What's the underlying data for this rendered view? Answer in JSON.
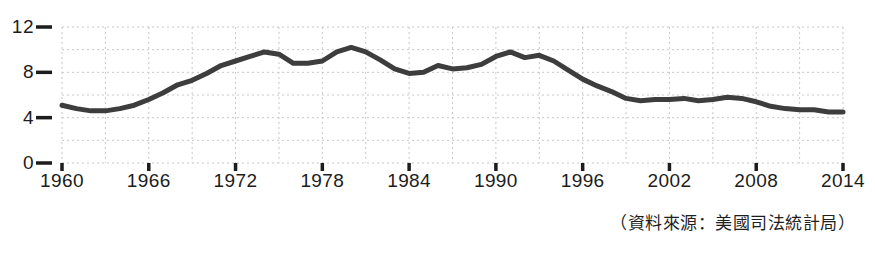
{
  "caption": "（資料來源：美國司法統計局）",
  "chart_data": {
    "type": "line",
    "title": "",
    "subtitle": "",
    "xlabel": "",
    "ylabel": "",
    "xlim": [
      1960,
      2014
    ],
    "ylim": [
      0,
      12
    ],
    "grid": true,
    "grid_style": "dashed",
    "legend": "none",
    "line_color": "#3d3d3d",
    "grid_color": "#c8c8c8",
    "axis_text_color": "#1c1c1c",
    "y_ticks": [
      0,
      4,
      8,
      12
    ],
    "y_tick_labels": [
      "0",
      "4",
      "8",
      "12"
    ],
    "y_gridlines": [
      0,
      2,
      4,
      6,
      8,
      10,
      12
    ],
    "x_ticks": [
      1960,
      1966,
      1972,
      1978,
      1984,
      1990,
      1996,
      2002,
      2008,
      2014
    ],
    "x_tick_labels": [
      "1960",
      "1966",
      "1972",
      "1978",
      "1984",
      "1990",
      "1996",
      "2002",
      "2008",
      "2014"
    ],
    "x_gridlines": [
      1960,
      1963,
      1966,
      1969,
      1972,
      1975,
      1978,
      1981,
      1984,
      1987,
      1990,
      1993,
      1996,
      1999,
      2002,
      2005,
      2008,
      2011,
      2014
    ],
    "series": [
      {
        "name": "homicide-rate",
        "x": [
          1960,
          1961,
          1962,
          1963,
          1964,
          1965,
          1966,
          1967,
          1968,
          1969,
          1970,
          1971,
          1972,
          1973,
          1974,
          1975,
          1976,
          1977,
          1978,
          1979,
          1980,
          1981,
          1982,
          1983,
          1984,
          1985,
          1986,
          1987,
          1988,
          1989,
          1990,
          1991,
          1992,
          1993,
          1994,
          1995,
          1996,
          1997,
          1998,
          1999,
          2000,
          2001,
          2002,
          2003,
          2004,
          2005,
          2006,
          2007,
          2008,
          2009,
          2010,
          2011,
          2012,
          2013,
          2014
        ],
        "values": [
          5.1,
          4.8,
          4.6,
          4.6,
          4.8,
          5.1,
          5.6,
          6.2,
          6.9,
          7.3,
          7.9,
          8.6,
          9.0,
          9.4,
          9.8,
          9.6,
          8.8,
          8.8,
          9.0,
          9.8,
          10.2,
          9.8,
          9.1,
          8.3,
          7.9,
          8.0,
          8.6,
          8.3,
          8.4,
          8.7,
          9.4,
          9.8,
          9.3,
          9.5,
          9.0,
          8.2,
          7.4,
          6.8,
          6.3,
          5.7,
          5.5,
          5.6,
          5.6,
          5.7,
          5.5,
          5.6,
          5.8,
          5.7,
          5.4,
          5.0,
          4.8,
          4.7,
          4.7,
          4.5,
          4.5
        ]
      }
    ]
  }
}
